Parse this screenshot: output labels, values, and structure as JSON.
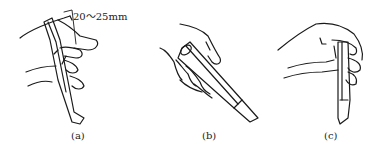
{
  "figure": {
    "panels": [
      {
        "id": "a",
        "caption": "(a)",
        "annotation": "20～25mm"
      },
      {
        "id": "b",
        "caption": "(b)"
      },
      {
        "id": "c",
        "caption": "(c)"
      }
    ],
    "stroke_color": "#1a1a1a",
    "background": "#ffffff"
  }
}
